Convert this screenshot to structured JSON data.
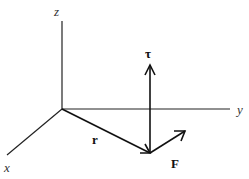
{
  "diagram": {
    "type": "3d-coordinate-vector-diagram",
    "axes": {
      "x": {
        "label": "x"
      },
      "y": {
        "label": "y"
      },
      "z": {
        "label": "z"
      }
    },
    "vectors": {
      "r": {
        "label": "r"
      },
      "F": {
        "label": "F"
      },
      "tau": {
        "label": "τ"
      }
    },
    "colors": {
      "line": "#222222",
      "background": "#ffffff"
    }
  }
}
